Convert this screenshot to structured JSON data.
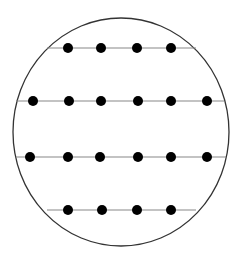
{
  "diagram": {
    "circle": {
      "cx": 121,
      "cy": 132,
      "rx": 108,
      "ry": 114,
      "stroke": "#333333"
    },
    "line_color": "#888888",
    "dot_color": "#000000",
    "dot_radius": 5,
    "rows": [
      {
        "y": 48,
        "x1": 47,
        "x2": 196,
        "dots": [
          68,
          101,
          137,
          171
        ]
      },
      {
        "y": 101,
        "x1": 16,
        "x2": 224,
        "dots": [
          33,
          69,
          101,
          138,
          171,
          207
        ]
      },
      {
        "y": 157,
        "x1": 16,
        "x2": 226,
        "dots": [
          30,
          68,
          100,
          138,
          171,
          207
        ]
      },
      {
        "y": 210,
        "x1": 47,
        "x2": 196,
        "dots": [
          68,
          102,
          137,
          171
        ]
      }
    ]
  }
}
